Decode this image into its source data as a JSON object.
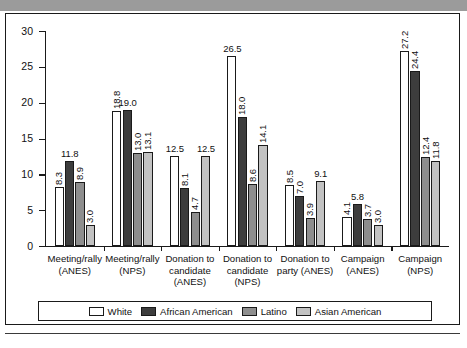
{
  "chart_data": {
    "type": "bar",
    "title": "",
    "xlabel": "",
    "ylabel": "",
    "ylim": [
      0,
      30
    ],
    "yticks": [
      "0",
      "5",
      "10",
      "15",
      "20",
      "25",
      "30"
    ],
    "grid": false,
    "legend_position": "bottom",
    "categories": [
      "Meeting/rally (ANES)",
      "Meeting/rally (NPS)",
      "Donation to candidate (ANES)",
      "Donation to candidate (NPS)",
      "Donation to party (ANES)",
      "Campaign (ANES)",
      "Campaign (NPS)"
    ],
    "category_lines": [
      [
        "Meeting/rally",
        "(ANES)"
      ],
      [
        "Meeting/rally",
        "(NPS)"
      ],
      [
        "Donation to",
        "candidate",
        "(ANES)"
      ],
      [
        "Donation to",
        "candidate",
        "(NPS)"
      ],
      [
        "Donation to",
        "party (ANES)"
      ],
      [
        "Campaign",
        "(ANES)"
      ],
      [
        "Campaign",
        "(NPS)"
      ]
    ],
    "series": [
      {
        "name": "White",
        "color": "#ffffff",
        "values": [
          8.3,
          18.8,
          12.5,
          26.5,
          8.5,
          4.1,
          27.2
        ]
      },
      {
        "name": "African American",
        "color": "#3d3d3d",
        "values": [
          11.8,
          19.0,
          8.1,
          18.0,
          7.0,
          5.8,
          24.4
        ]
      },
      {
        "name": "Latino",
        "color": "#8e8e8e",
        "values": [
          8.9,
          13.0,
          4.7,
          8.6,
          3.9,
          3.7,
          12.4
        ]
      },
      {
        "name": "Asian American",
        "color": "#c2c2c2",
        "values": [
          3.0,
          13.1,
          12.5,
          14.1,
          9.1,
          3.0,
          11.8
        ]
      }
    ],
    "value_labels": [
      [
        "8.3",
        "11.8",
        "8.9",
        "3.0"
      ],
      [
        "18.8",
        "19.0",
        "13.0",
        "13.1"
      ],
      [
        "12.5",
        "8.1",
        "4.7",
        "12.5"
      ],
      [
        "26.5",
        "18.0",
        "8.6",
        "14.1"
      ],
      [
        "8.5",
        "7.0",
        "3.9",
        "9.1"
      ],
      [
        "4.1",
        "5.8",
        "3.7",
        "3.0"
      ],
      [
        "27.2",
        "24.4",
        "12.4",
        "11.8"
      ]
    ]
  },
  "legend": {
    "items": [
      {
        "label": "White"
      },
      {
        "label": "African American"
      },
      {
        "label": "Latino"
      },
      {
        "label": "Asian American"
      }
    ]
  },
  "caption": {
    "text": ""
  }
}
